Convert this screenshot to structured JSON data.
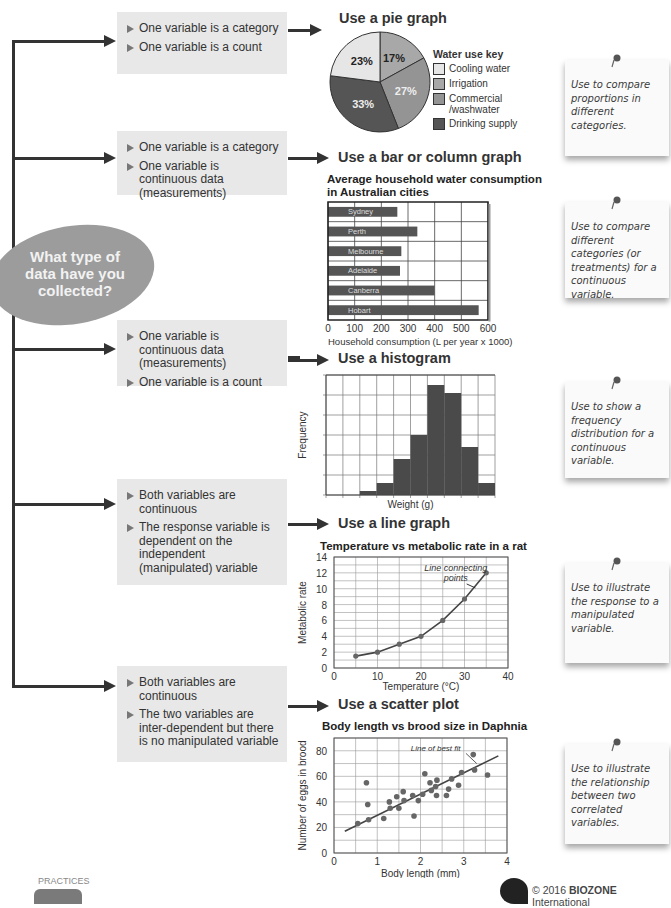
{
  "flowchart": {
    "question": "What type of data have you collected?",
    "question_lines": [
      "What type of",
      "data have you",
      "collected?"
    ],
    "rows": [
      {
        "conditions": [
          "One variable is a category",
          "One variable is a count"
        ],
        "recommendation": "Use a pie graph",
        "note": "Use to compare proportions in different categories."
      },
      {
        "conditions": [
          "One variable is a category",
          "One variable is continuous data (measurements)"
        ],
        "recommendation": "Use a bar or column graph",
        "note": "Use to compare different categories (or treatments) for a continuous variable."
      },
      {
        "conditions": [
          "One variable is continuous data (measurements)",
          "One variable is a count"
        ],
        "recommendation": "Use a histogram",
        "note": "Use to show a frequency distribution for a continuous variable."
      },
      {
        "conditions": [
          "Both variables are continuous",
          "The response variable is dependent on the independent (manipulated) variable"
        ],
        "recommendation": "Use a line graph",
        "note": "Use to illustrate the response to a manipulated variable."
      },
      {
        "conditions": [
          "Both variables are continuous",
          "The two variables are inter-dependent but there is no manipulated variable"
        ],
        "recommendation": "Use a scatter plot",
        "note": "Use to illustrate the relationship between two correlated variables."
      }
    ]
  },
  "chart_data": [
    {
      "type": "pie",
      "title": "Use a pie graph",
      "legend_title": "Water use key",
      "categories": [
        "Irrigation",
        "Commercial /washwater",
        "Drinking supply",
        "Cooling water"
      ],
      "values": [
        17,
        27,
        33,
        23
      ],
      "labels": [
        "17%",
        "27%",
        "33%",
        "23%"
      ],
      "colors": [
        "#a8a8a8",
        "#949494",
        "#555555",
        "#e6e6e6"
      ],
      "legend_order": [
        {
          "label": "Cooling water",
          "color": "#e6e6e6"
        },
        {
          "label": "Irrigation",
          "color": "#a8a8a8"
        },
        {
          "label": "Commercial /washwater",
          "color": "#949494"
        },
        {
          "label": "Drinking supply",
          "color": "#555555"
        }
      ]
    },
    {
      "type": "bar",
      "orientation": "horizontal",
      "title": "Average household water consumption in Australian cities",
      "categories": [
        "Sydney",
        "Perth",
        "Melbourne",
        "Adelaide",
        "Canberra",
        "Hobart"
      ],
      "values": [
        260,
        335,
        275,
        270,
        400,
        565
      ],
      "xlabel": "Household consumption (L per year x 1000)",
      "ylabel": "",
      "xlim": [
        0,
        600
      ],
      "xticks": [
        0,
        100,
        200,
        300,
        400,
        500,
        600
      ],
      "grid": true,
      "color": "#555555"
    },
    {
      "type": "bar",
      "subtype": "histogram",
      "title": "",
      "bins": 10,
      "values": [
        0,
        0,
        0.2,
        0.6,
        1.8,
        3.0,
        5.5,
        5.1,
        2.4,
        0.6
      ],
      "xlabel": "Weight (g)",
      "ylabel": "Frequency",
      "ylim": [
        0,
        6
      ],
      "grid": true,
      "color": "#4a4a4a"
    },
    {
      "type": "line",
      "title": "Temperature vs metabolic rate in a rat",
      "x": [
        5,
        10,
        15,
        20,
        25,
        30,
        35
      ],
      "y": [
        1.5,
        2,
        3,
        4,
        6,
        8.7,
        12
      ],
      "xlabel": "Temperature (°C)",
      "ylabel": "Metabolic rate",
      "xlim": [
        0,
        40
      ],
      "ylim": [
        0,
        14
      ],
      "xticks": [
        0,
        10,
        20,
        30,
        40
      ],
      "yticks": [
        0,
        2,
        4,
        6,
        8,
        10,
        12,
        14
      ],
      "annotation": "Line connecting points",
      "annotation_lines": [
        "Line connecting",
        "points"
      ],
      "grid": true
    },
    {
      "type": "scatter",
      "title": "Body length vs brood size in Daphnia",
      "x": [
        0.55,
        0.75,
        0.78,
        0.8,
        1.15,
        1.28,
        1.3,
        1.45,
        1.5,
        1.6,
        1.62,
        1.82,
        1.85,
        1.95,
        2.05,
        2.1,
        2.22,
        2.25,
        2.35,
        2.37,
        2.38,
        2.6,
        2.65,
        2.72,
        2.88,
        2.95,
        3.22,
        3.25,
        3.55
      ],
      "y": [
        23,
        55,
        38,
        26,
        27,
        40,
        35,
        44,
        35,
        48,
        41,
        45,
        29,
        41,
        46,
        62,
        55,
        49,
        52,
        45,
        57,
        45,
        50,
        58,
        53,
        63,
        77,
        65,
        61
      ],
      "xlabel": "Body length (mm)",
      "ylabel": "Number of eggs in brood",
      "xlim": [
        0,
        4
      ],
      "ylim": [
        0,
        90
      ],
      "xticks": [
        0,
        1,
        2,
        3,
        4
      ],
      "yticks": [
        0,
        20,
        40,
        60,
        80
      ],
      "best_fit": {
        "x": [
          0.25,
          3.8
        ],
        "y": [
          17,
          76
        ]
      },
      "annotation": "Line of best fit",
      "grid": true
    }
  ],
  "footer": {
    "left_label": "PRACTICES",
    "copyright_prefix": "© 2016 ",
    "brand": "BIOZONE",
    "copyright_suffix": " International"
  }
}
